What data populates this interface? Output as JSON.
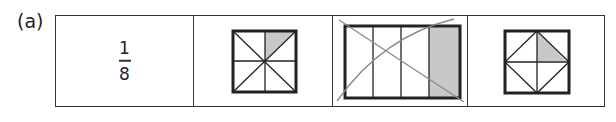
{
  "question": {
    "label": "(a)",
    "fraction": {
      "numerator": "1",
      "denominator": "8"
    },
    "shapes": [
      {
        "name": "square-8-triangles",
        "parts": 8,
        "shaded": 1,
        "crossed_out": false
      },
      {
        "name": "rectangle-4-strips",
        "parts": 4,
        "shaded": 1,
        "crossed_out": true
      },
      {
        "name": "square-diamond",
        "parts": 8,
        "shaded": 1,
        "crossed_out": false
      }
    ],
    "colors": {
      "line": "#222222",
      "shade": "#c8c8c8",
      "cross": "#8a8a8a"
    }
  }
}
